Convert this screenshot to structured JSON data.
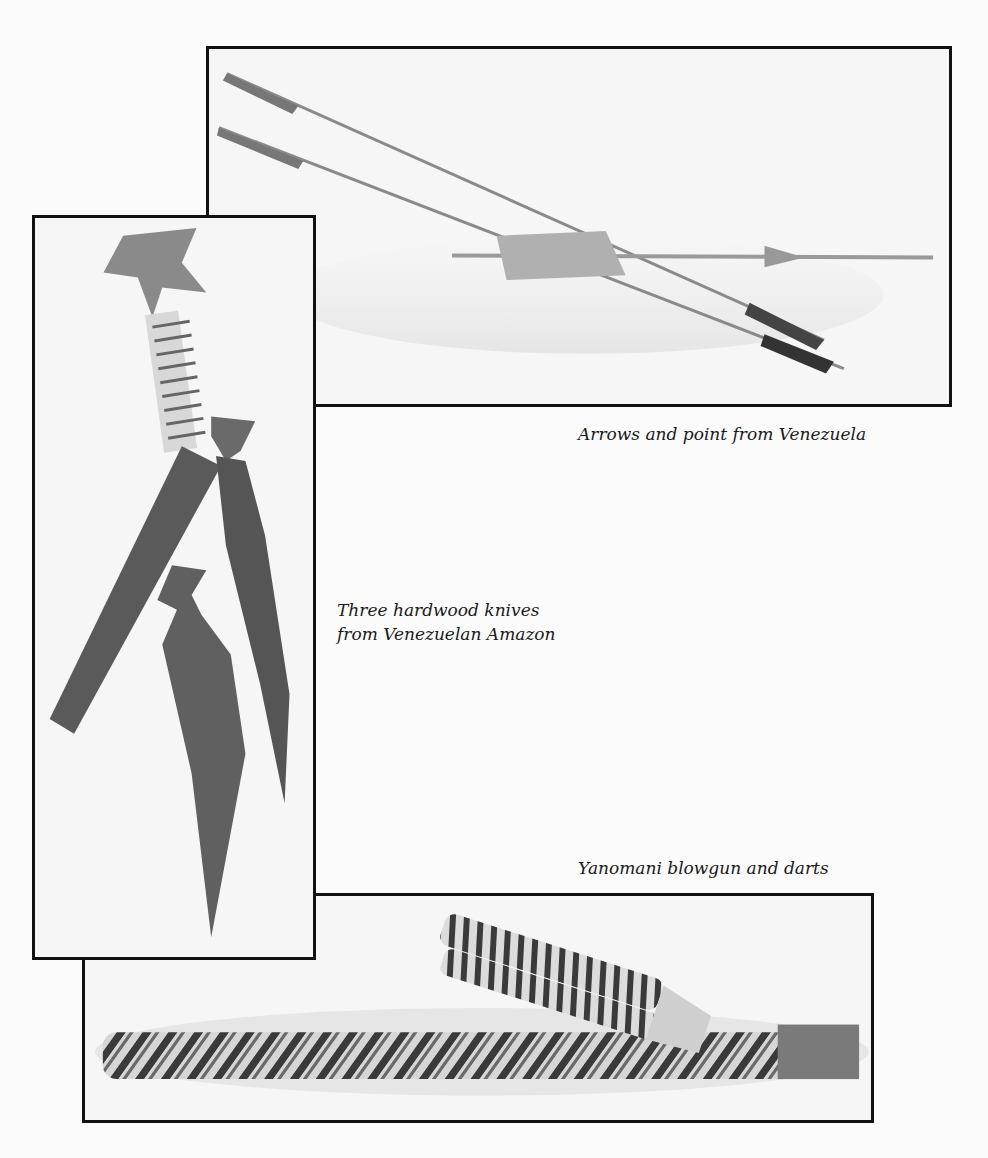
{
  "page": {
    "background": "#fbfbfb",
    "frame_border_color": "#111111"
  },
  "figures": [
    {
      "id": "arrows",
      "caption": "Arrows and point from Venezuela",
      "subject": "two long arrows with dark fletching crossed over a feathered point"
    },
    {
      "id": "knives",
      "caption_lines": [
        "Three hardwood knives",
        "from Venezuelan Amazon"
      ],
      "subject": "three dark hardwood knives with star-shaped pommels and wrapped handles"
    },
    {
      "id": "blowgun",
      "caption": "Yanomani blowgun and darts",
      "subject": "woven-wrapped blowgun tube with dart quiver"
    }
  ]
}
